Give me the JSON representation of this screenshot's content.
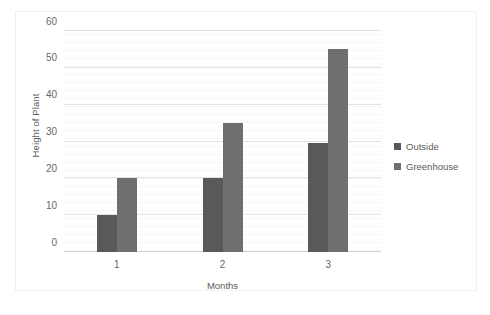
{
  "chart_data": {
    "type": "bar",
    "title": "",
    "xlabel": "Months",
    "ylabel": "Height of Plant",
    "categories": [
      "1",
      "2",
      "3"
    ],
    "series": [
      {
        "name": "Outside",
        "color": "#595959",
        "values": [
          10,
          20,
          29.5
        ]
      },
      {
        "name": "Greenhouse",
        "color": "#6f6f6f",
        "values": [
          20,
          35,
          55
        ]
      }
    ],
    "ylim": [
      0,
      60
    ],
    "yticks": [
      0,
      10,
      20,
      30,
      40,
      50,
      60
    ],
    "ytick_labels": [
      "0",
      "10",
      "20",
      "30",
      "40",
      "50",
      "60"
    ],
    "grid": true,
    "grid_axis": "y",
    "legend_position": "right",
    "background_color": "#ffffff",
    "gridline_color": "#e2e2e2",
    "border_color": "#f0f0f0"
  }
}
